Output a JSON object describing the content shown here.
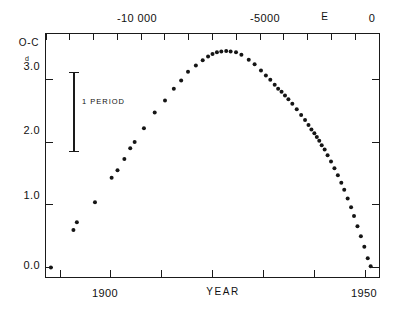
{
  "chart_data": {
    "type": "scatter",
    "title": "",
    "ylabel": "O-C",
    "xlabel": "YEAR",
    "x2label": "E",
    "ylabel_unit_superscript": "d",
    "bottom_axis": {
      "name": "YEAR",
      "tick_labels": [
        "1900",
        "1950"
      ],
      "tick_label_values": [
        1900,
        1950
      ],
      "range": [
        1884,
        1952
      ],
      "n_ticks": 7
    },
    "top_axis": {
      "name": "E",
      "tick_labels": [
        "-10 000",
        "-5000",
        "0"
      ],
      "tick_label_values": [
        -10000,
        -5000,
        0
      ],
      "range": [
        -13500,
        500
      ],
      "n_ticks": 15
    },
    "yaxis": {
      "tick_labels": [
        "3.0",
        "2.0",
        "1.0",
        "0.0"
      ],
      "tick_values": [
        3.0,
        2.0,
        1.0,
        0.0
      ],
      "range": [
        -0.15,
        3.72
      ],
      "unit": "days"
    },
    "grid": false,
    "legend": false,
    "annotation": {
      "label": "1 PERIOD",
      "type": "vertical-error-bar",
      "bar_top_value": 3.1,
      "bar_bottom_value": 1.85
    },
    "series": [
      {
        "name": "O-C residuals",
        "marker": "filled-circle",
        "color": "#151515",
        "points": [
          [
            1885.0,
            0.0
          ],
          [
            1889.6,
            0.6
          ],
          [
            1890.3,
            0.72
          ],
          [
            1894.0,
            1.04
          ],
          [
            1897.4,
            1.43
          ],
          [
            1898.6,
            1.55
          ],
          [
            1900.0,
            1.73
          ],
          [
            1901.2,
            1.9
          ],
          [
            1902.1,
            2.0
          ],
          [
            1904.0,
            2.22
          ],
          [
            1906.2,
            2.47
          ],
          [
            1908.3,
            2.66
          ],
          [
            1910.1,
            2.85
          ],
          [
            1911.6,
            2.98
          ],
          [
            1913.0,
            3.12
          ],
          [
            1914.6,
            3.22
          ],
          [
            1916.0,
            3.3
          ],
          [
            1917.1,
            3.36
          ],
          [
            1918.0,
            3.4
          ],
          [
            1918.9,
            3.43
          ],
          [
            1919.8,
            3.44
          ],
          [
            1920.8,
            3.45
          ],
          [
            1921.7,
            3.44
          ],
          [
            1922.8,
            3.43
          ],
          [
            1923.9,
            3.39
          ],
          [
            1925.4,
            3.31
          ],
          [
            1926.6,
            3.24
          ],
          [
            1927.9,
            3.14
          ],
          [
            1928.9,
            3.06
          ],
          [
            1929.8,
            2.99
          ],
          [
            1930.7,
            2.91
          ],
          [
            1931.4,
            2.85
          ],
          [
            1932.1,
            2.8
          ],
          [
            1932.8,
            2.74
          ],
          [
            1933.5,
            2.68
          ],
          [
            1934.3,
            2.61
          ],
          [
            1935.2,
            2.52
          ],
          [
            1936.1,
            2.43
          ],
          [
            1936.9,
            2.35
          ],
          [
            1937.6,
            2.27
          ],
          [
            1938.2,
            2.2
          ],
          [
            1938.8,
            2.14
          ],
          [
            1939.3,
            2.08
          ],
          [
            1939.8,
            2.02
          ],
          [
            1940.3,
            1.95
          ],
          [
            1940.9,
            1.88
          ],
          [
            1941.5,
            1.79
          ],
          [
            1942.2,
            1.69
          ],
          [
            1942.9,
            1.58
          ],
          [
            1943.6,
            1.47
          ],
          [
            1944.3,
            1.35
          ],
          [
            1944.9,
            1.24
          ],
          [
            1945.6,
            1.1
          ],
          [
            1946.3,
            0.96
          ],
          [
            1946.9,
            0.82
          ],
          [
            1947.6,
            0.66
          ],
          [
            1948.3,
            0.5
          ],
          [
            1949.0,
            0.33
          ],
          [
            1949.7,
            0.15
          ],
          [
            1950.3,
            0.02
          ]
        ]
      }
    ]
  }
}
